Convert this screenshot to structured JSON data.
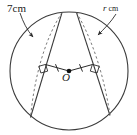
{
  "figure": {
    "type": "geometry-diagram",
    "background_color": "#ffffff",
    "stroke_color": "#3a3a3a",
    "dashed_color": "#6a6a6a",
    "labels": {
      "left_chord_label": "7cm",
      "right_chord_variable": "r",
      "right_chord_unit": " cm",
      "centre_label": "O"
    },
    "marks": {
      "equal_tick_count_left": 1,
      "equal_tick_count_right": 1,
      "right_angle_marker_left": true,
      "right_angle_marker_right": true,
      "centre_point_filled": true,
      "leader_arrow_left": true,
      "leader_arrow_right": true
    },
    "geometry": {
      "circle_center_x": 69,
      "circle_center_y": 71,
      "circle_radius": 59,
      "left_chord_from": [
        62,
        12
      ],
      "left_chord_to": [
        30,
        118
      ],
      "right_chord_from": [
        76,
        12
      ],
      "right_chord_to": [
        110,
        116
      ],
      "perpendicular_foot_left": [
        44,
        66
      ],
      "perpendicular_foot_right": [
        94,
        66
      ]
    }
  }
}
